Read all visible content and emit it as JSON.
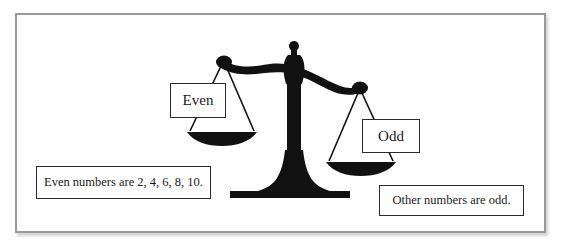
{
  "diagram": {
    "type": "balance-scale-illustration",
    "pan_labels": {
      "left": "Even",
      "right": "Odd"
    },
    "notes": {
      "even": "Even numbers are 2, 4, 6, 8, 10.",
      "odd": "Other numbers are odd."
    },
    "icons": {
      "scale": "balance-scale-icon"
    },
    "colors": {
      "frame_border": "#9a9a9a",
      "scale_fill": "#111111",
      "box_border": "#2a2a2a",
      "background": "#ffffff"
    }
  }
}
